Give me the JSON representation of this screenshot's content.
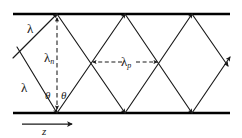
{
  "figure": {
    "type": "ray-zigzag-waveguide-diagram",
    "background_color": "#ffffff",
    "ink_color": "#1a1a1a",
    "wall_color": "#000000",
    "labels": {
      "lambda_upper": "λ",
      "lambda_lower": "λ",
      "lambda_n_symbol": "λ",
      "lambda_n_subscript": "n",
      "lambda_p_symbol": "λ",
      "lambda_p_subscript": "p",
      "theta_left": "θ",
      "theta_right": "θ",
      "axis_z": "z"
    },
    "geometry": {
      "top_wall_y": 14,
      "bottom_wall_y": 113,
      "wall_x_start": 13,
      "wall_x_end": 230,
      "top_vertices_x": [
        57,
        125,
        192
      ],
      "bottom_vertices_x": [
        57,
        125,
        192
      ],
      "crossings_x": [
        91,
        159
      ],
      "period_label_span_x": [
        91,
        159
      ],
      "normal_line_x": 57,
      "z_axis_y": 124,
      "z_axis_x_start": 22,
      "z_axis_x_end": 72
    }
  }
}
